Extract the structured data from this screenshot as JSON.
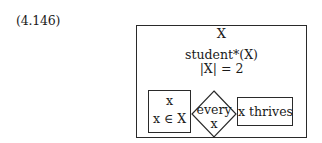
{
  "equation_label": "(4.146)",
  "drs": {
    "universe": "X",
    "conditions": [
      "student*(X)",
      "|X| = 2"
    ],
    "duplex": {
      "restrictor": {
        "referent": "x",
        "condition": "x ∈ X"
      },
      "quantifier": {
        "determiner": "every",
        "variable": "x"
      },
      "scope": {
        "condition": "x thrives"
      }
    }
  },
  "colors": {
    "line": "#2a2a2a",
    "text": "#1a1a1a",
    "background": "#ffffff"
  }
}
